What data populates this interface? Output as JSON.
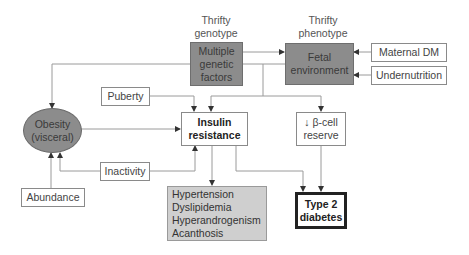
{
  "labels": {
    "thrifty_genotype": [
      "Thrifty",
      "genotype"
    ],
    "thrifty_phenotype": [
      "Thrifty",
      "phenotype"
    ]
  },
  "nodes": {
    "multiple_genetic_factors": [
      "Multiple",
      "genetic",
      "factors"
    ],
    "fetal_environment": [
      "Fetal",
      "environment"
    ],
    "maternal_dm": "Maternal DM",
    "undernutrition": "Undernutrition",
    "puberty": "Puberty",
    "insulin_resistance": [
      "Insulin",
      "resistance"
    ],
    "beta_cell_reserve": [
      "↓ β-cell",
      "reserve"
    ],
    "obesity": [
      "Obesity",
      "(visceral)"
    ],
    "inactivity": "Inactivity",
    "abundance": "Abundance",
    "complications": [
      "Hypertension",
      "Dyslipidemia",
      "Hyperandrogenism",
      "Acanthosis"
    ],
    "type2_diabetes": [
      "Type 2",
      "diabetes"
    ]
  },
  "colors": {
    "dark_fill": "#8c8c8c",
    "light_fill": "#cfcfcf",
    "line": "#8a8a8a",
    "arrow": "#333333"
  }
}
